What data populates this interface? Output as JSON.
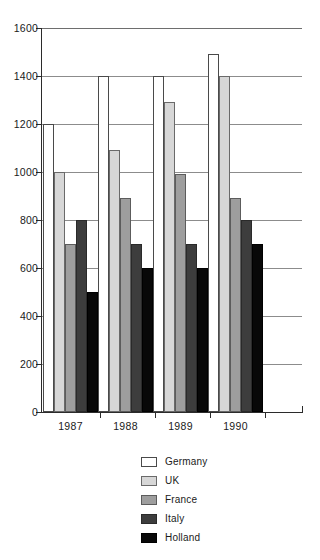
{
  "chart_data": {
    "type": "bar",
    "title": "",
    "subtitle": "",
    "xlabel": "",
    "ylabel": "",
    "categories": [
      "1987",
      "1988",
      "1989",
      "1990"
    ],
    "series": [
      {
        "name": "Germany",
        "color": "#ffffff",
        "values": [
          1200,
          1400,
          1400,
          1490
        ]
      },
      {
        "name": "UK",
        "color": "#d7d7d7",
        "values": [
          1000,
          1090,
          1290,
          1400
        ]
      },
      {
        "name": "France",
        "color": "#9e9e9e",
        "values": [
          700,
          890,
          990,
          890
        ]
      },
      {
        "name": "Italy",
        "color": "#3d3d3d",
        "values": [
          800,
          700,
          700,
          800
        ]
      },
      {
        "name": "Holland",
        "color": "#080808",
        "values": [
          500,
          600,
          600,
          700
        ]
      }
    ],
    "ylim": [
      0,
      1600
    ],
    "ytick_step": 200,
    "yticks": [
      "1600",
      "1400",
      "1200",
      "1000",
      "800",
      "600",
      "400",
      "200",
      "0"
    ],
    "grid": "horizontal",
    "legend_position": "bottom-center",
    "legend_entries": [
      "Germany",
      "UK",
      "France",
      "Italy",
      "Holland"
    ]
  }
}
